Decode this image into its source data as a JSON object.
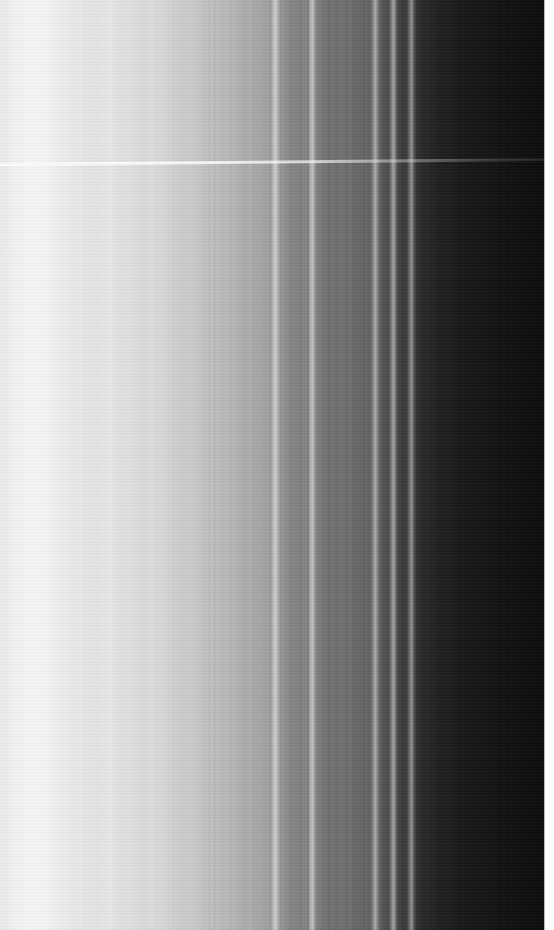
{
  "image": {
    "title": "Saturn Ring Radial Brightness Scan",
    "kind": "grayscale-radial-ring-scan",
    "width_px": 554,
    "height_px": 930,
    "orientation": "vertical-bands",
    "colorspace": "grayscale",
    "background_color": "#000000",
    "brightest_color": "#fdfdfd",
    "darkest_color": "#0a0a0a"
  },
  "chart_data": {
    "type": "line",
    "xlabel": "Radial position (pixel column)",
    "ylabel": "Brightness (0-255)",
    "xlim": [
      0,
      554
    ],
    "ylim": [
      0,
      255
    ],
    "grid": false,
    "legend": "none",
    "x": [
      0,
      14,
      30,
      46,
      60,
      72,
      84,
      96,
      108,
      120,
      132,
      144,
      152,
      160,
      168,
      176,
      184,
      192,
      200,
      208,
      216,
      224,
      232,
      240,
      248,
      256,
      264,
      270,
      275,
      280,
      286,
      292,
      298,
      304,
      308,
      312,
      316,
      322,
      330,
      340,
      350,
      360,
      368,
      375,
      381,
      387,
      393,
      399,
      405,
      411,
      417,
      424,
      432,
      442,
      455,
      470,
      486,
      502,
      518,
      532,
      542,
      544,
      554
    ],
    "values": [
      237,
      243,
      248,
      246,
      240,
      236,
      233,
      231,
      234,
      229,
      226,
      222,
      224,
      219,
      215,
      212,
      208,
      205,
      201,
      197,
      193,
      189,
      185,
      181,
      177,
      173,
      169,
      166,
      232,
      150,
      146,
      143,
      141,
      139,
      137,
      226,
      128,
      124,
      121,
      118,
      114,
      110,
      106,
      214,
      92,
      84,
      206,
      70,
      62,
      198,
      52,
      44,
      38,
      33,
      29,
      26,
      23,
      20,
      17,
      15,
      14,
      250,
      252
    ],
    "annotations": [
      {
        "label": "bright inner ring region",
        "x_range": [
          0,
          70
        ],
        "mean_value": 243
      },
      {
        "label": "gradual outward dimming",
        "x_range": [
          70,
          270
        ],
        "mean_value": 200
      },
      {
        "label": "narrow bright ringlet",
        "x_range": [
          273,
          278
        ],
        "peak_value": 232
      },
      {
        "label": "narrow bright ringlet",
        "x_range": [
          310,
          315
        ],
        "peak_value": 226
      },
      {
        "label": "narrow bright ringlet",
        "x_range": [
          373,
          378
        ],
        "peak_value": 214
      },
      {
        "label": "narrow bright ringlet",
        "x_range": [
          391,
          396
        ],
        "peak_value": 206
      },
      {
        "label": "narrow bright ringlet",
        "x_range": [
          409,
          414
        ],
        "peak_value": 198
      },
      {
        "label": "dark outer ring region",
        "x_range": [
          420,
          543
        ],
        "mean_value": 25
      },
      {
        "label": "bright overscan edge strip",
        "x_range": [
          544,
          554
        ],
        "mean_value": 251
      },
      {
        "label": "horizontal scan-line artifact",
        "y_range": [
          158,
          165
        ],
        "peak_value": 255
      }
    ]
  },
  "bands": [
    {
      "name": "band-inner-bright-a",
      "x": 0,
      "w": 10,
      "value": 236
    },
    {
      "name": "band-inner-bright-b",
      "x": 10,
      "w": 12,
      "value": 241
    },
    {
      "name": "band-inner-peak",
      "x": 22,
      "w": 16,
      "value": 248
    },
    {
      "name": "band-inner-bright-c",
      "x": 38,
      "w": 14,
      "value": 245
    },
    {
      "name": "band-a1",
      "x": 52,
      "w": 14,
      "value": 239
    },
    {
      "name": "band-a2",
      "x": 66,
      "w": 12,
      "value": 234
    },
    {
      "name": "band-a3",
      "x": 78,
      "w": 14,
      "value": 231
    },
    {
      "name": "band-a4",
      "x": 92,
      "w": 10,
      "value": 235
    },
    {
      "name": "band-a5",
      "x": 102,
      "w": 14,
      "value": 229
    },
    {
      "name": "band-a6",
      "x": 116,
      "w": 14,
      "value": 225
    },
    {
      "name": "band-a7",
      "x": 130,
      "w": 12,
      "value": 222
    },
    {
      "name": "band-a8",
      "x": 142,
      "w": 10,
      "value": 226
    },
    {
      "name": "band-b1",
      "x": 152,
      "w": 14,
      "value": 218
    },
    {
      "name": "band-b2",
      "x": 166,
      "w": 14,
      "value": 212
    },
    {
      "name": "band-b3",
      "x": 180,
      "w": 14,
      "value": 206
    },
    {
      "name": "band-b4",
      "x": 194,
      "w": 14,
      "value": 200
    },
    {
      "name": "band-b5",
      "x": 208,
      "w": 14,
      "value": 194
    },
    {
      "name": "band-b6",
      "x": 222,
      "w": 14,
      "value": 188
    },
    {
      "name": "band-b7",
      "x": 236,
      "w": 14,
      "value": 181
    },
    {
      "name": "band-b8",
      "x": 250,
      "w": 14,
      "value": 174
    },
    {
      "name": "band-b9",
      "x": 264,
      "w": 9,
      "value": 168
    },
    {
      "name": "ringlet-1",
      "x": 273,
      "w": 5,
      "value": 232
    },
    {
      "name": "band-c1",
      "x": 278,
      "w": 12,
      "value": 150
    },
    {
      "name": "band-c2",
      "x": 290,
      "w": 10,
      "value": 143
    },
    {
      "name": "band-c3",
      "x": 300,
      "w": 10,
      "value": 139
    },
    {
      "name": "ringlet-2",
      "x": 310,
      "w": 5,
      "value": 226
    },
    {
      "name": "band-d1",
      "x": 315,
      "w": 14,
      "value": 129
    },
    {
      "name": "band-d2",
      "x": 329,
      "w": 14,
      "value": 122
    },
    {
      "name": "band-d3",
      "x": 343,
      "w": 14,
      "value": 115
    },
    {
      "name": "band-d4",
      "x": 357,
      "w": 16,
      "value": 107
    },
    {
      "name": "ringlet-3",
      "x": 373,
      "w": 5,
      "value": 214
    },
    {
      "name": "band-e1",
      "x": 378,
      "w": 13,
      "value": 88
    },
    {
      "name": "ringlet-4",
      "x": 391,
      "w": 5,
      "value": 206
    },
    {
      "name": "band-e2",
      "x": 396,
      "w": 13,
      "value": 66
    },
    {
      "name": "ringlet-5",
      "x": 409,
      "w": 5,
      "value": 198
    },
    {
      "name": "band-f1",
      "x": 414,
      "w": 14,
      "value": 46
    },
    {
      "name": "band-f2",
      "x": 428,
      "w": 18,
      "value": 34
    },
    {
      "name": "band-f3",
      "x": 446,
      "w": 22,
      "value": 27
    },
    {
      "name": "band-f4",
      "x": 468,
      "w": 24,
      "value": 22
    },
    {
      "name": "band-f5",
      "x": 492,
      "w": 26,
      "value": 18
    },
    {
      "name": "band-f6",
      "x": 518,
      "w": 26,
      "value": 14
    },
    {
      "name": "edge-strip",
      "x": 544,
      "w": 10,
      "value": 251
    }
  ],
  "scanline": {
    "name": "horizontal-scanline-artifact",
    "y_left": 163,
    "y_right": 158,
    "thickness_px": 3
  }
}
